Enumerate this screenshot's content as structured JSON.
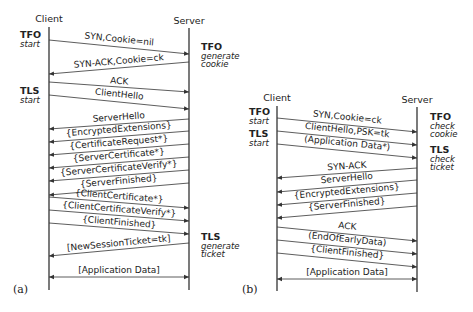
{
  "diagrams": [
    {
      "caption": "(a)",
      "client_label": "Client",
      "server_label": "Server",
      "annotations": [
        {
          "side": "client",
          "title": "TFO",
          "lines": [
            "start"
          ]
        },
        {
          "side": "server",
          "title": "TFO",
          "lines": [
            "generate",
            "cookie"
          ]
        },
        {
          "side": "client",
          "title": "TLS",
          "lines": [
            "start"
          ]
        },
        {
          "side": "server",
          "title": "TLS",
          "lines": [
            "generate",
            "ticket"
          ]
        }
      ],
      "messages": [
        {
          "label": "SYN,Cookie=nil",
          "direction": "to-server"
        },
        {
          "label": "SYN-ACK,Cookie=ck",
          "direction": "to-client"
        },
        {
          "label": "ACK",
          "direction": "to-server"
        },
        {
          "label": "ClientHello",
          "direction": "to-server"
        },
        {
          "label": "ServerHello",
          "direction": "to-client"
        },
        {
          "label": "{EncryptedExtensions}",
          "direction": "to-client"
        },
        {
          "label": "{CertificateRequest*}",
          "direction": "to-client"
        },
        {
          "label": "{ServerCertificate*}",
          "direction": "to-client"
        },
        {
          "label": "{ServerCertificateVerify*}",
          "direction": "to-client"
        },
        {
          "label": "{ServerFinished}",
          "direction": "to-client"
        },
        {
          "label": "{ClientCertificate*}",
          "direction": "to-server"
        },
        {
          "label": "{ClientCertificateVerify*}",
          "direction": "to-server"
        },
        {
          "label": "{ClientFinished}",
          "direction": "to-server"
        },
        {
          "label": "[NewSessionTicket=tk]",
          "direction": "to-client"
        },
        {
          "label": "[Application Data]",
          "direction": "both"
        }
      ]
    },
    {
      "caption": "(b)",
      "client_label": "Client",
      "server_label": "Server",
      "annotations": [
        {
          "side": "client",
          "title": "TFO",
          "lines": [
            "start"
          ]
        },
        {
          "side": "server",
          "title": "TFO",
          "lines": [
            "check",
            "cookie"
          ]
        },
        {
          "side": "client",
          "title": "TLS",
          "lines": [
            "start"
          ]
        },
        {
          "side": "server",
          "title": "TLS",
          "lines": [
            "check",
            "ticket"
          ]
        }
      ],
      "messages": [
        {
          "label": "SYN,Cookie=ck",
          "direction": "to-server"
        },
        {
          "label": "ClientHello,PSK=tk",
          "direction": "to-server"
        },
        {
          "label": "(Application Data*)",
          "direction": "to-server"
        },
        {
          "label": "SYN-ACK",
          "direction": "to-client"
        },
        {
          "label": "ServerHello",
          "direction": "to-client"
        },
        {
          "label": "{EncryptedExtensions}",
          "direction": "to-client"
        },
        {
          "label": "{ServerFinished}",
          "direction": "to-client"
        },
        {
          "label": "ACK",
          "direction": "to-server"
        },
        {
          "label": "(EndOfEarlyData)",
          "direction": "to-server"
        },
        {
          "label": "{ClientFinished}",
          "direction": "to-server"
        },
        {
          "label": "[Application Data]",
          "direction": "both"
        }
      ]
    }
  ]
}
